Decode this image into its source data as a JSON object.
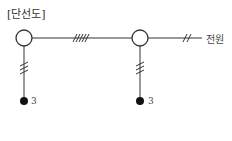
{
  "diagram": {
    "title": "[단선도]",
    "source_label": "전원",
    "nodes": [
      {
        "id": "bus-left",
        "type": "open-circle",
        "load_label": "3"
      },
      {
        "id": "bus-right",
        "type": "open-circle",
        "load_label": "3"
      }
    ],
    "lines": [
      {
        "from": "bus-left",
        "to": "bus-right",
        "conductor_ticks": 5
      },
      {
        "from": "bus-right",
        "to": "source",
        "conductor_ticks": 2
      },
      {
        "from": "bus-left",
        "to": "load-left",
        "conductor_ticks": 3
      },
      {
        "from": "bus-right",
        "to": "load-right",
        "conductor_ticks": 3
      }
    ]
  }
}
